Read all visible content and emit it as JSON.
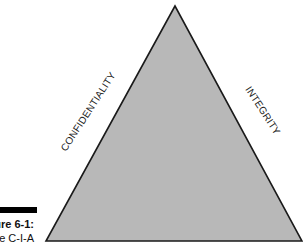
{
  "diagram": {
    "shape": "triangle",
    "fill_color": "#b8b8b8",
    "stroke_color": "#1a1a1a",
    "vertices": {
      "apex": [
        175,
        6
      ],
      "bottom_left": [
        46,
        241
      ],
      "bottom_right": [
        302,
        241
      ]
    },
    "sides": {
      "left": "CONFIDENTIALITY",
      "right": "INTEGRITY"
    }
  },
  "caption": {
    "figure_label": "Figure 6-1:",
    "text": "The C-I-A"
  }
}
